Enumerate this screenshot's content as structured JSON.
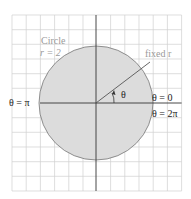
{
  "diagram": {
    "circle_label_line1": "Circle",
    "circle_label_line2": "r = 2",
    "radius_label": "fixed r",
    "angle_label": "θ",
    "theta_pi_label": "θ = π",
    "theta_zero_label": "θ = 0",
    "theta_2pi_label": "θ = 2π",
    "colors": {
      "grid": "#d0d0d0",
      "axis": "#333333",
      "circle_fill": "#dcdcdc",
      "circle_stroke": "#777777",
      "gray_text": "#9a9a9a",
      "dark_text": "#222222"
    },
    "geometry": {
      "center": [
        96,
        103
      ],
      "radius_px": 57,
      "radius_units": 2,
      "ray_angle_deg": 37,
      "grid_spacing_px": 14.2
    }
  }
}
